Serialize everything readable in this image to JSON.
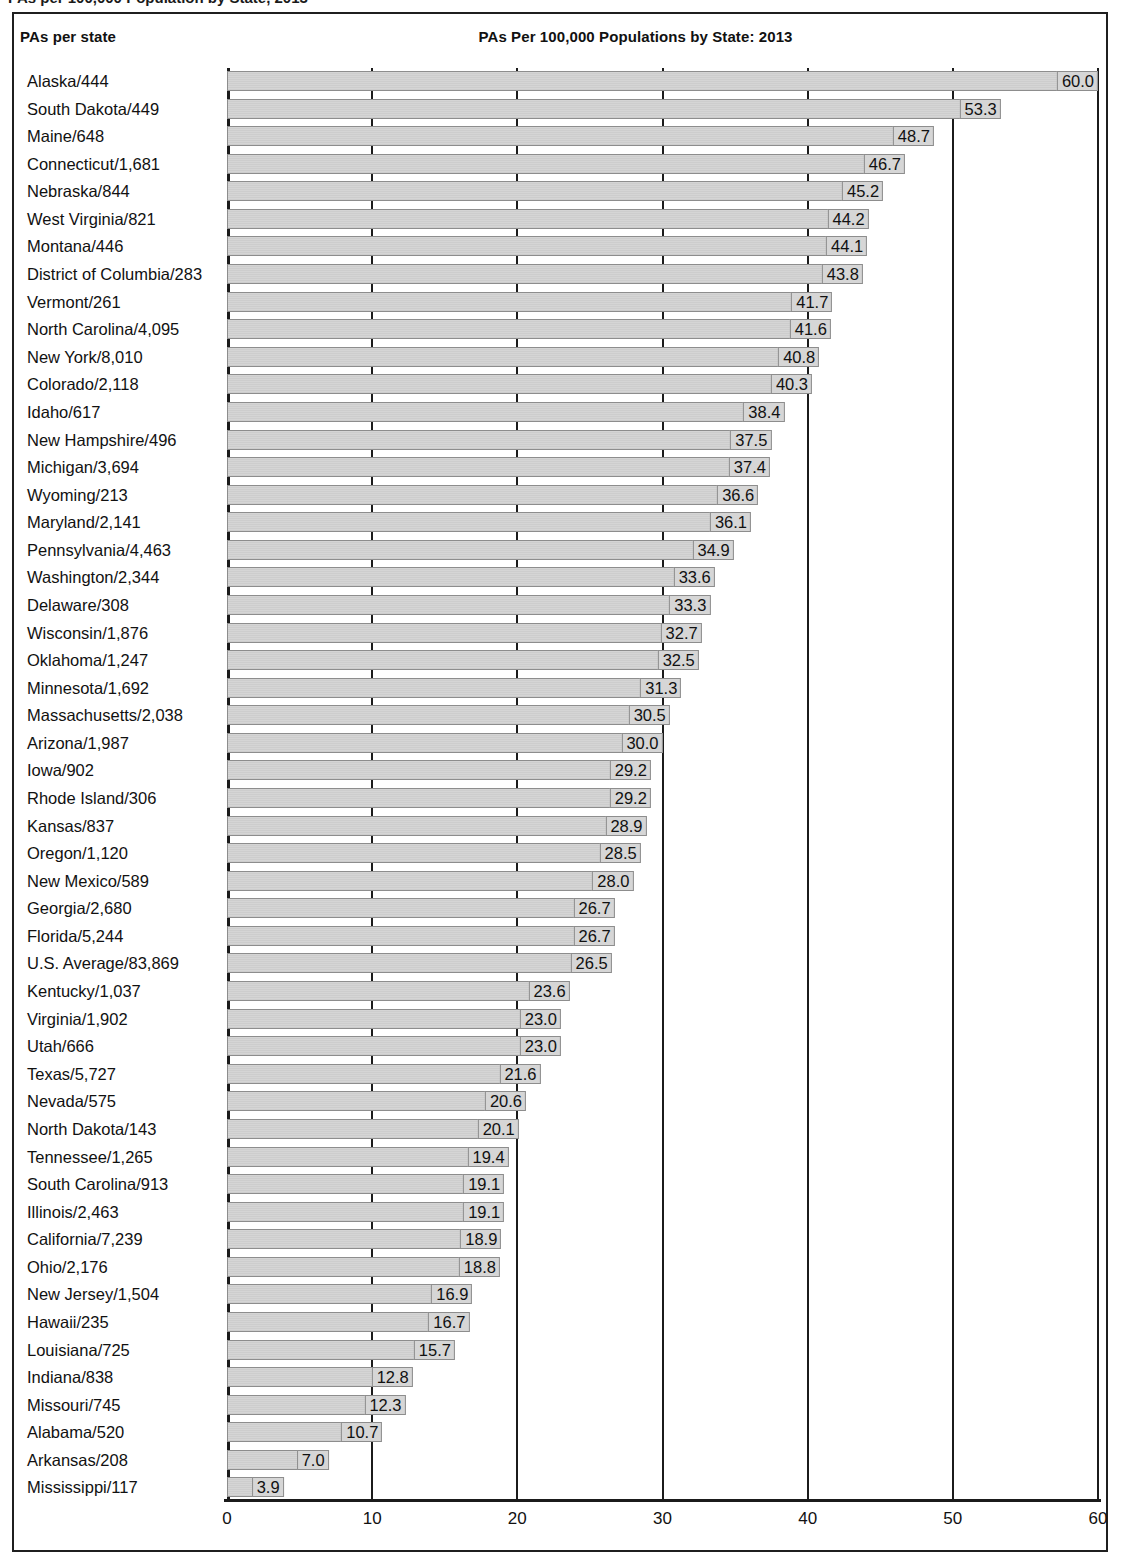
{
  "caption": "PAs per 100,000 Population by State, 2013",
  "legend_title": "PAs per state",
  "chart_title": "PAs Per 100,000 Populations by State: 2013",
  "chart_data": {
    "type": "bar",
    "orientation": "horizontal",
    "title": "PAs Per 100,000 Populations by State: 2013",
    "xlabel": "",
    "ylabel": "PAs per state",
    "xlim": [
      0,
      60
    ],
    "xticks": [
      0,
      10,
      20,
      30,
      40,
      50,
      60
    ],
    "xticklabels": [
      "0",
      "10",
      "20",
      "30",
      "40",
      "50",
      "60"
    ],
    "grid": true,
    "legend": false,
    "bar_color": "#d4d4d4",
    "bar_edge_color": "#8d8d8d",
    "axis_color": "#1b1b1b",
    "categories": [
      "Alaska/444",
      "South Dakota/449",
      "Maine/648",
      "Connecticut/1,681",
      "Nebraska/844",
      "West Virginia/821",
      "Montana/446",
      "District of Columbia/283",
      "Vermont/261",
      "North Carolina/4,095",
      "New York/8,010",
      "Colorado/2,118",
      "Idaho/617",
      "New Hampshire/496",
      "Michigan/3,694",
      "Wyoming/213",
      "Maryland/2,141",
      "Pennsylvania/4,463",
      "Washington/2,344",
      "Delaware/308",
      "Wisconsin/1,876",
      "Oklahoma/1,247",
      "Minnesota/1,692",
      "Massachusetts/2,038",
      "Arizona/1,987",
      "Iowa/902",
      "Rhode Island/306",
      "Kansas/837",
      "Oregon/1,120",
      "New Mexico/589",
      "Georgia/2,680",
      "Florida/5,244",
      "U.S. Average/83,869",
      "Kentucky/1,037",
      "Virginia/1,902",
      "Utah/666",
      "Texas/5,727",
      "Nevada/575",
      "North Dakota/143",
      "Tennessee/1,265",
      "South Carolina/913",
      "Illinois/2,463",
      "California/7,239",
      "Ohio/2,176",
      "New Jersey/1,504",
      "Hawaii/235",
      "Louisiana/725",
      "Indiana/838",
      "Missouri/745",
      "Alabama/520",
      "Arkansas/208",
      "Mississippi/117"
    ],
    "values": [
      60.0,
      53.3,
      48.7,
      46.7,
      45.2,
      44.2,
      44.1,
      43.8,
      41.7,
      41.6,
      40.8,
      40.3,
      38.4,
      37.5,
      37.4,
      36.6,
      36.1,
      34.9,
      33.6,
      33.3,
      32.7,
      32.5,
      31.3,
      30.5,
      30.0,
      29.2,
      29.2,
      28.9,
      28.5,
      28.0,
      26.7,
      26.7,
      26.5,
      23.6,
      23.0,
      23.0,
      21.6,
      20.6,
      20.1,
      19.4,
      19.1,
      19.1,
      18.9,
      18.8,
      16.9,
      16.7,
      15.7,
      12.8,
      12.3,
      10.7,
      7.0,
      3.9
    ],
    "value_labels": [
      "60.0",
      "53.3",
      "48.7",
      "46.7",
      "45.2",
      "44.2",
      "44.1",
      "43.8",
      "41.7",
      "41.6",
      "40.8",
      "40.3",
      "38.4",
      "37.5",
      "37.4",
      "36.6",
      "36.1",
      "34.9",
      "33.6",
      "33.3",
      "32.7",
      "32.5",
      "31.3",
      "30.5",
      "30.0",
      "29.2",
      "29.2",
      "28.9",
      "28.5",
      "28.0",
      "26.7",
      "26.7",
      "26.5",
      "23.6",
      "23.0",
      "23.0",
      "21.6",
      "20.6",
      "20.1",
      "19.4",
      "19.1",
      "19.1",
      "18.9",
      "18.8",
      "16.9",
      "16.7",
      "15.7",
      "12.8",
      "12.3",
      "10.7",
      "7.0",
      "3.9"
    ]
  }
}
